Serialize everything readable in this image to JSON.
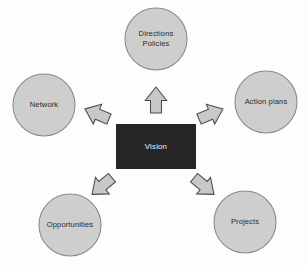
{
  "diagram": {
    "background_color": "#fdfdfd",
    "center": {
      "label": "Vision",
      "fill_color": "#262626",
      "text_color": "#f2f2f2",
      "x": 116,
      "y": 124,
      "width": 80,
      "height": 45
    },
    "node_style": {
      "fill_color": "#cecece",
      "stroke_color": "#8a8a8a",
      "text_color": "#2b2b2b",
      "radius": 31
    },
    "arrow_style": {
      "fill_color": "#c8c8c8",
      "stroke_color": "#4a4a4a"
    },
    "nodes": [
      {
        "id": "directions-policies",
        "lines": [
          "Directions",
          "Policies"
        ],
        "cx": 156,
        "cy": 39,
        "r": 31
      },
      {
        "id": "network",
        "lines": [
          "Network"
        ],
        "cx": 44,
        "cy": 105,
        "r": 31
      },
      {
        "id": "action-plans",
        "lines": [
          "Action plans"
        ],
        "cx": 266,
        "cy": 102,
        "r": 31
      },
      {
        "id": "opportunities",
        "lines": [
          "Opportunities"
        ],
        "cx": 70,
        "cy": 225,
        "r": 31
      },
      {
        "id": "projects",
        "lines": [
          "Projects"
        ],
        "cx": 245,
        "cy": 222,
        "r": 31
      }
    ],
    "arrows": [
      {
        "id": "arrow-up",
        "direction": "up",
        "from": "vision",
        "to": "directions-policies",
        "angle_deg": -90,
        "cx": 156,
        "cy": 100,
        "length": 26,
        "width": 11
      },
      {
        "id": "arrow-up-left",
        "direction": "up-left",
        "from": "vision",
        "to": "network",
        "angle_deg": -157,
        "cx": 97,
        "cy": 114,
        "length": 26,
        "width": 11
      },
      {
        "id": "arrow-up-right",
        "direction": "up-right",
        "from": "vision",
        "to": "action-plans",
        "angle_deg": -23,
        "cx": 211,
        "cy": 114,
        "length": 26,
        "width": 11
      },
      {
        "id": "arrow-down-left",
        "direction": "down-left",
        "from": "vision",
        "to": "opportunities",
        "angle_deg": 140,
        "cx": 102,
        "cy": 186,
        "length": 26,
        "width": 11
      },
      {
        "id": "arrow-down-right",
        "direction": "down-right",
        "from": "vision",
        "to": "projects",
        "angle_deg": 40,
        "cx": 204,
        "cy": 186,
        "length": 26,
        "width": 11
      }
    ]
  }
}
